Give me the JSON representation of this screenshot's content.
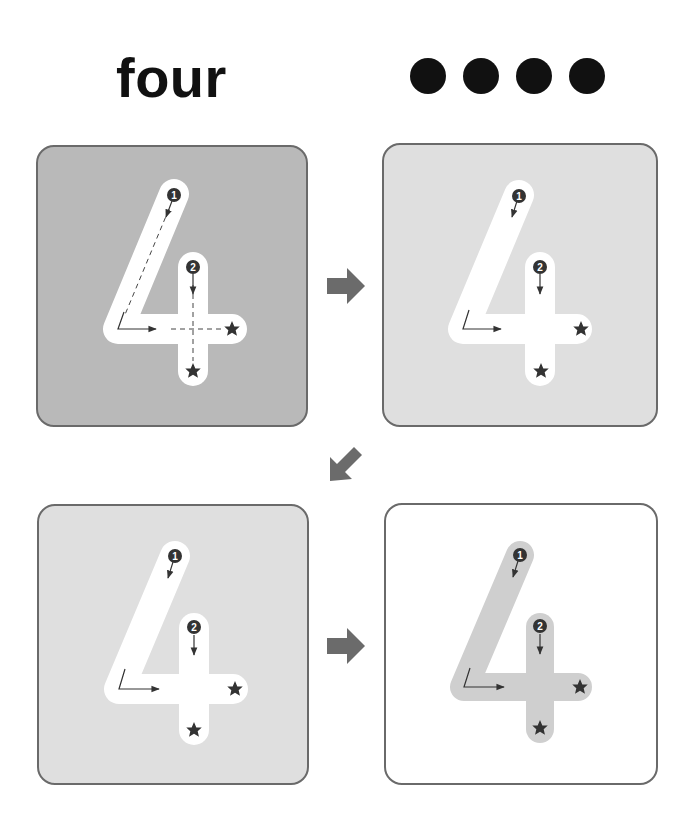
{
  "header": {
    "word": "four",
    "count_dots": 4,
    "dot_icon": "filled-circle"
  },
  "colors": {
    "dot": "#111111",
    "panel_border": "#6a6a6a",
    "arrow": "#6b6b6b",
    "guide_ink": "#333333",
    "panel_dark_bg": "#b9b9b9",
    "panel_light_bg": "#dfdfdf",
    "panel_white_bg": "#ffffff",
    "track_white": "#ffffff",
    "track_gray": "#cfcfcf"
  },
  "steps": [
    {
      "id": "step-1",
      "digit": "4",
      "background": "#b9b9b9",
      "track": "#ffffff",
      "dashed_guides": true,
      "stroke_labels": [
        "1",
        "2"
      ],
      "end_markers": [
        "star",
        "star"
      ]
    },
    {
      "id": "step-2",
      "digit": "4",
      "background": "#dfdfdf",
      "track": "#ffffff",
      "dashed_guides": false,
      "stroke_labels": [
        "1",
        "2"
      ],
      "end_markers": [
        "star",
        "star"
      ]
    },
    {
      "id": "step-3",
      "digit": "4",
      "background": "#dfdfdf",
      "track": "#ffffff",
      "dashed_guides": false,
      "stroke_labels": [
        "1",
        "2"
      ],
      "end_markers": [
        "star",
        "star"
      ]
    },
    {
      "id": "step-4",
      "digit": "4",
      "background": "#ffffff",
      "track": "#cfcfcf",
      "dashed_guides": false,
      "stroke_labels": [
        "1",
        "2"
      ],
      "end_markers": [
        "star",
        "star"
      ]
    }
  ],
  "flow_arrows": [
    {
      "from": "step-1",
      "to": "step-2",
      "direction": "right"
    },
    {
      "from": "step-2",
      "to": "step-3",
      "direction": "down-left"
    },
    {
      "from": "step-3",
      "to": "step-4",
      "direction": "right"
    }
  ]
}
